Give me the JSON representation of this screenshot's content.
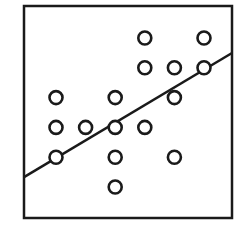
{
  "chart_data": {
    "type": "scatter",
    "title": "",
    "xlabel": "",
    "ylabel": "",
    "xlim": [
      0,
      7
    ],
    "ylim": [
      0,
      7
    ],
    "grid": false,
    "legend": null,
    "series": [
      {
        "name": "points",
        "marker": "open-circle",
        "points": [
          {
            "x": 4,
            "y": 6
          },
          {
            "x": 6,
            "y": 6
          },
          {
            "x": 4,
            "y": 5
          },
          {
            "x": 5,
            "y": 5
          },
          {
            "x": 6,
            "y": 5
          },
          {
            "x": 1,
            "y": 4
          },
          {
            "x": 3,
            "y": 4
          },
          {
            "x": 5,
            "y": 4
          },
          {
            "x": 1,
            "y": 3
          },
          {
            "x": 2,
            "y": 3
          },
          {
            "x": 3,
            "y": 3
          },
          {
            "x": 4,
            "y": 3
          },
          {
            "x": 1,
            "y": 2
          },
          {
            "x": 3,
            "y": 2
          },
          {
            "x": 5,
            "y": 2
          },
          {
            "x": 3,
            "y": 1
          }
        ]
      }
    ],
    "fit_line": {
      "name": "regression-line",
      "x": [
        0,
        7
      ],
      "y": [
        1.38,
        5.53
      ]
    }
  },
  "style": {
    "stroke_color": "#1a1a1a",
    "background": "#ffffff"
  }
}
